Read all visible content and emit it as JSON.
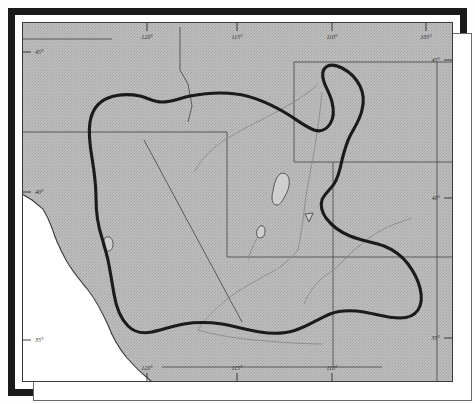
{
  "figure": {
    "kind": "scanned-map",
    "region": "Western United States — Colorado River Basin",
    "frame_color": "#1a1a1a",
    "land_fill": "#b9b9b9",
    "ocean_fill": "#ffffff",
    "basin_line_color": "#1c1c1c",
    "state_line_color": "#4a4a4a",
    "river_line_color": "#7c7c7c"
  },
  "graticule": {
    "longitude_ticks_top": [
      {
        "label": "120°",
        "x": 125
      },
      {
        "label": "115°",
        "x": 215
      },
      {
        "label": "110°",
        "x": 310
      },
      {
        "label": "105°",
        "x": 404
      }
    ],
    "longitude_ticks_bottom": [
      {
        "label": "120°",
        "x": 125
      },
      {
        "label": "115°",
        "x": 215
      },
      {
        "label": "110°",
        "x": 310
      }
    ],
    "latitude_ticks_left": [
      {
        "label": "45°",
        "y": 50
      },
      {
        "label": "40°",
        "y": 190
      },
      {
        "label": "35°",
        "y": 338
      }
    ],
    "latitude_ticks_right": [
      {
        "label": "45°",
        "y": 58
      },
      {
        "label": "40°",
        "y": 196
      },
      {
        "label": "35°",
        "y": 336
      }
    ]
  },
  "map_features": {
    "basin_boundary_name": "drainage-basin-boundary",
    "lakes": [
      "great-salt-lake",
      "utah-lake",
      "lake-tahoe",
      "sevier-lake"
    ],
    "coastline_name": "pacific-coastline",
    "rivers": [
      "colorado-river",
      "green-river",
      "san-juan-river",
      "little-colorado-river",
      "gila-river"
    ]
  }
}
